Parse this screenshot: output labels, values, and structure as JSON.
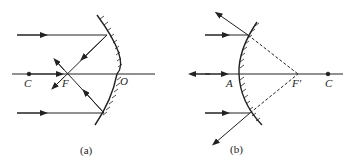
{
  "figure_a": {
    "caption": "(a)",
    "labels": {
      "center": "C",
      "focus": "F",
      "vertex": "O"
    },
    "mirror_type": "concave"
  },
  "figure_b": {
    "caption": "(b)",
    "labels": {
      "vertex": "A",
      "focus": "F'",
      "center": "C"
    },
    "mirror_type": "convex"
  },
  "colors": {
    "line": "#222222",
    "background": "#ffffff"
  }
}
